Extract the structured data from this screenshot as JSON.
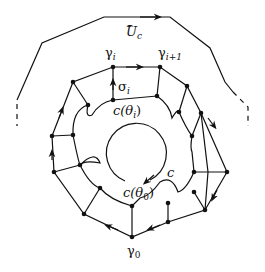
{
  "diagram": {
    "labels": {
      "outer_set": "U",
      "outer_set_sub": "c",
      "gamma_i": "γ",
      "gamma_i_sub": "i",
      "gamma_i1": "γ",
      "gamma_i1_sub": "i+1",
      "sigma_i": "σ",
      "sigma_i_sub": "i",
      "c_theta_i": "c(θ",
      "c_theta_i_sub": "i",
      "c_theta_i_close": ")",
      "curve_c": "c",
      "c_theta_0": "c(θ",
      "c_theta_0_sub": "0",
      "c_theta_0_close": ")",
      "gamma_0": "γ",
      "gamma_0_sub": "0"
    },
    "colors": {
      "stroke": "#111111",
      "background": "#ffffff"
    }
  }
}
